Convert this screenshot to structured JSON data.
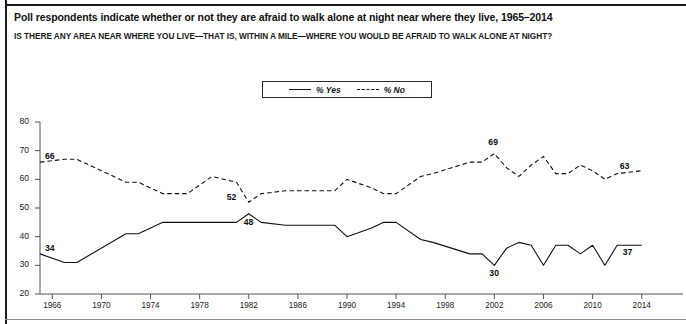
{
  "header": {
    "title": "Poll respondents indicate whether or not they are afraid to walk alone at night near where they live, 1965–2014",
    "subtitle": "IS THERE ANY AREA NEAR WHERE YOU LIVE—THAT IS, WITHIN A MILE—WHERE YOU WOULD BE AFRAID TO WALK ALONE AT NIGHT?"
  },
  "legend": {
    "position": "top-center",
    "entries": [
      {
        "label": "% Yes",
        "style": "solid",
        "color": "#111111"
      },
      {
        "label": "% No",
        "style": "dashed",
        "color": "#111111"
      }
    ]
  },
  "footnote": {
    "text": ""
  },
  "chart_data": {
    "type": "line",
    "title": "Poll respondents indicate whether or not they are afraid to walk alone at night near where they live, 1965–2014",
    "subtitle": "IS THERE ANY AREA NEAR WHERE YOU LIVE—THAT IS, WITHIN A MILE—WHERE YOU WOULD BE AFRAID TO WALK ALONE AT NIGHT?",
    "xlabel": "",
    "ylabel": "",
    "xlim": [
      1965,
      2014
    ],
    "ylim": [
      20,
      80
    ],
    "ytick_values": [
      20,
      30,
      40,
      50,
      60,
      70,
      80
    ],
    "ytick_labels": [
      "20",
      "30",
      "40",
      "50",
      "60",
      "70",
      "80"
    ],
    "xtick_values": [
      1966,
      1970,
      1974,
      1978,
      1982,
      1986,
      1990,
      1994,
      1998,
      2002,
      2006,
      2010,
      2014
    ],
    "xtick_labels": [
      "1966",
      "1970",
      "1974",
      "1978",
      "1982",
      "1986",
      "1990",
      "1994",
      "1998",
      "2002",
      "2006",
      "2010",
      "2014"
    ],
    "grid": false,
    "series": [
      {
        "name": "% Yes",
        "style": "solid",
        "color": "#111111",
        "x": [
          1965,
          1967,
          1968,
          1972,
          1973,
          1975,
          1977,
          1979,
          1981,
          1982,
          1983,
          1985,
          1989,
          1990,
          1992,
          1993,
          1994,
          1996,
          1997,
          2000,
          2001,
          2002,
          2003,
          2004,
          2005,
          2006,
          2007,
          2008,
          2009,
          2010,
          2011,
          2012,
          2014
        ],
        "y": [
          34,
          31,
          31,
          41,
          41,
          45,
          45,
          45,
          45,
          48,
          45,
          44,
          44,
          40,
          43,
          45,
          45,
          39,
          38,
          34,
          34,
          30,
          36,
          38,
          37,
          30,
          37,
          37,
          34,
          37,
          30,
          37,
          37
        ]
      },
      {
        "name": "% No",
        "style": "dashed",
        "color": "#111111",
        "x": [
          1965,
          1967,
          1968,
          1972,
          1973,
          1975,
          1977,
          1979,
          1981,
          1982,
          1983,
          1985,
          1989,
          1990,
          1992,
          1993,
          1994,
          1996,
          1997,
          2000,
          2001,
          2002,
          2003,
          2004,
          2005,
          2006,
          2007,
          2008,
          2009,
          2010,
          2011,
          2012,
          2014
        ],
        "y": [
          66,
          67,
          67,
          59,
          59,
          55,
          55,
          61,
          59,
          52,
          55,
          56,
          56,
          60,
          57,
          55,
          55,
          61,
          62,
          66,
          66,
          69,
          64,
          61,
          65,
          68,
          62,
          62,
          65,
          63,
          60,
          62,
          63
        ]
      }
    ],
    "data_labels": [
      {
        "series": "% No",
        "value": "66",
        "x": 1965,
        "y": 66,
        "anchor": "right"
      },
      {
        "series": "% Yes",
        "value": "34",
        "x": 1965,
        "y": 34,
        "anchor": "right"
      },
      {
        "series": "% No",
        "value": "52",
        "x": 1982,
        "y": 52,
        "anchor": "above-left"
      },
      {
        "series": "% Yes",
        "value": "48",
        "x": 1982,
        "y": 48,
        "anchor": "below"
      },
      {
        "series": "% No",
        "value": "69",
        "x": 2002,
        "y": 69,
        "anchor": "above"
      },
      {
        "series": "% Yes",
        "value": "30",
        "x": 2002,
        "y": 30,
        "anchor": "below"
      },
      {
        "series": "% No",
        "value": "63",
        "x": 2014,
        "y": 63,
        "anchor": "above-left"
      },
      {
        "series": "% Yes",
        "value": "37",
        "x": 2014,
        "y": 37,
        "anchor": "below-left"
      }
    ]
  }
}
